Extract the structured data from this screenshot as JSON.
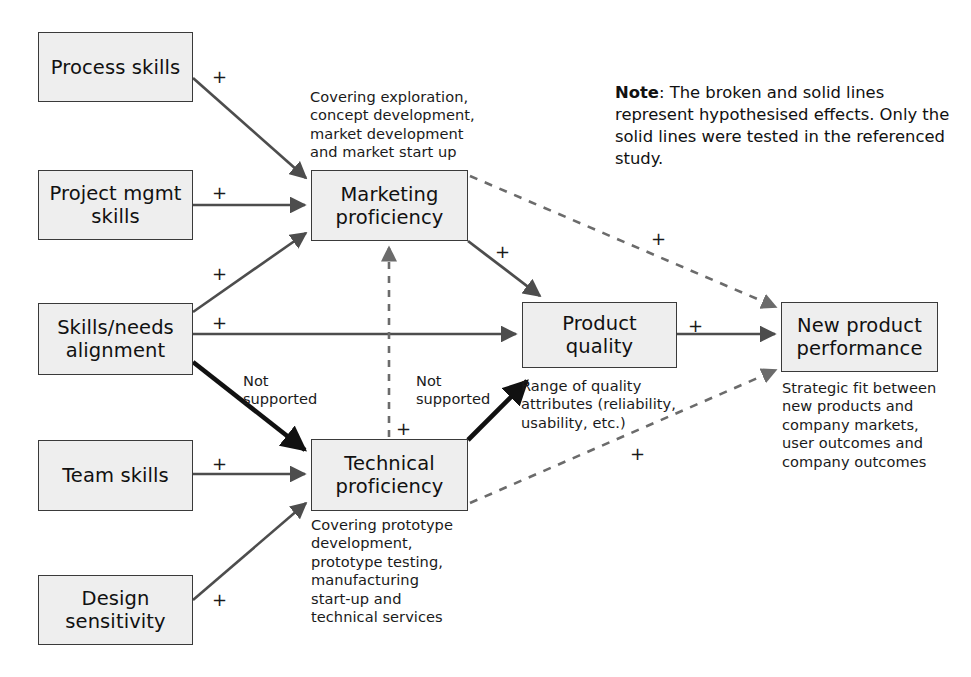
{
  "diagram": {
    "colors": {
      "node_fill": "#eeeeee",
      "node_border": "#3a3a3a",
      "solid_edge": "#4d4d4d",
      "bold_edge": "#111111",
      "dashed_edge": "#6b6b6b",
      "text": "#1a1a1a"
    },
    "nodes": [
      {
        "id": "process-skills",
        "label": "Process skills"
      },
      {
        "id": "project-mgmt-skills",
        "label": "Project mgmt\nskills"
      },
      {
        "id": "skills-needs-alignment",
        "label": "Skills/needs\nalignment"
      },
      {
        "id": "team-skills",
        "label": "Team skills"
      },
      {
        "id": "design-sensitivity",
        "label": "Design\nsensitivity"
      },
      {
        "id": "marketing-proficiency",
        "label": "Marketing\nproficiency"
      },
      {
        "id": "technical-proficiency",
        "label": "Technical\nproficiency"
      },
      {
        "id": "product-quality",
        "label": "Product\nquality"
      },
      {
        "id": "new-product-performance",
        "label": "New product\nperformance"
      }
    ],
    "annotations": [
      {
        "id": "marketing-proficiency-note",
        "text": "Covering exploration,\nconcept development,\nmarket development\nand market start up"
      },
      {
        "id": "technical-proficiency-note",
        "text": "Covering prototype\ndevelopment,\nprototype testing,\nmanufacturing\nstart-up and\ntechnical services"
      },
      {
        "id": "product-quality-note",
        "text": "Range of quality\nattributes (reliability,\nusability, etc.)"
      },
      {
        "id": "new-product-performance-note",
        "text": "Strategic fit between\nnew products and\ncompany markets,\nuser outcomes and\ncompany outcomes"
      }
    ],
    "note": {
      "label": "Note",
      "separator": ": ",
      "text": "The broken and solid lines represent hypothesised effects. Only the solid lines were tested in the referenced study."
    },
    "edge_labels": {
      "process_to_marketing": "+",
      "projectmgmt_to_marketing": "+",
      "skillsneeds_to_marketing": "+",
      "skillsneeds_to_productquality": "+",
      "skillsneeds_to_technical": "Not\nsupported",
      "team_to_technical": "+",
      "design_to_technical": "+",
      "technical_to_marketing": "+",
      "technical_to_productquality": "Not\nsupported",
      "marketing_to_productquality": "+",
      "marketing_to_newproduct": "+",
      "productquality_to_newproduct": "+",
      "technical_to_newproduct": "+"
    },
    "edges": [
      {
        "from": "process-skills",
        "to": "marketing-proficiency",
        "style": "solid",
        "sign": "+"
      },
      {
        "from": "project-mgmt-skills",
        "to": "marketing-proficiency",
        "style": "solid",
        "sign": "+"
      },
      {
        "from": "skills-needs-alignment",
        "to": "marketing-proficiency",
        "style": "solid",
        "sign": "+"
      },
      {
        "from": "skills-needs-alignment",
        "to": "product-quality",
        "style": "solid",
        "sign": "+"
      },
      {
        "from": "skills-needs-alignment",
        "to": "technical-proficiency",
        "style": "bold",
        "sign": "Not supported"
      },
      {
        "from": "team-skills",
        "to": "technical-proficiency",
        "style": "solid",
        "sign": "+"
      },
      {
        "from": "design-sensitivity",
        "to": "technical-proficiency",
        "style": "solid",
        "sign": "+"
      },
      {
        "from": "technical-proficiency",
        "to": "marketing-proficiency",
        "style": "dashed",
        "sign": "+"
      },
      {
        "from": "technical-proficiency",
        "to": "product-quality",
        "style": "bold",
        "sign": "Not supported"
      },
      {
        "from": "marketing-proficiency",
        "to": "product-quality",
        "style": "solid",
        "sign": "+"
      },
      {
        "from": "marketing-proficiency",
        "to": "new-product-performance",
        "style": "dashed",
        "sign": "+"
      },
      {
        "from": "product-quality",
        "to": "new-product-performance",
        "style": "solid",
        "sign": "+"
      },
      {
        "from": "technical-proficiency",
        "to": "new-product-performance",
        "style": "dashed",
        "sign": "+"
      }
    ]
  }
}
